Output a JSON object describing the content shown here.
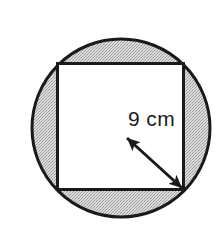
{
  "figure": {
    "background_color": "#ffffff",
    "width": 224,
    "height": 239
  },
  "circle": {
    "name": "outer-circle",
    "center_x": 121,
    "center_y": 128,
    "radius": 90,
    "fill_color": "#c9c9c9",
    "stroke_color": "#1a1a1a",
    "stroke_width": 3,
    "shading": "stipple"
  },
  "square": {
    "name": "inscribed-square",
    "left": 57,
    "top": 63,
    "side": 127,
    "fill_color": "#ffffff",
    "stroke_color": "#1a1a1a",
    "stroke_width": 3
  },
  "dimension_arrow": {
    "name": "radius-dimension-arrow",
    "label": "9 cm",
    "value": 9,
    "unit": "cm",
    "start_x": 126,
    "start_y": 137,
    "end_x": 183,
    "end_y": 189,
    "stroke_color": "#1a1a1a",
    "stroke_width": 3,
    "double_headed": true,
    "label_x": 128,
    "label_y": 125
  }
}
